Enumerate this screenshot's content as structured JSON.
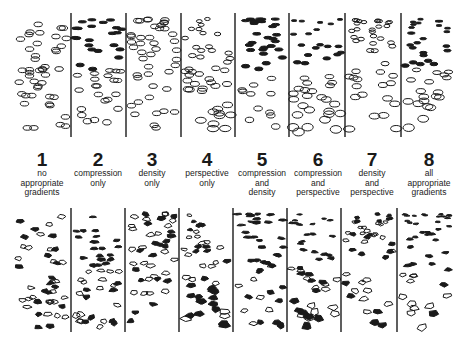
{
  "figure": {
    "top_row": {
      "description": "texture gradient panels (ellipse elements)",
      "y_top": 15,
      "y_bottom": 137,
      "dividers_x": [
        71,
        126,
        181,
        235,
        289,
        345,
        401
      ]
    },
    "bottom_row": {
      "description": "texture gradient panels (irregular elements)",
      "y_top": 210,
      "y_bottom": 332,
      "dividers_x": [
        71,
        125,
        179,
        233,
        287,
        341,
        397
      ]
    },
    "conditions": [
      {
        "number": "1",
        "lines": [
          "no",
          "appropriate",
          "gradients"
        ],
        "x": 42
      },
      {
        "number": "2",
        "lines": [
          "compression",
          "only"
        ],
        "x": 98
      },
      {
        "number": "3",
        "lines": [
          "density",
          "only"
        ],
        "x": 152
      },
      {
        "number": "4",
        "lines": [
          "perspective",
          "only"
        ],
        "x": 207
      },
      {
        "number": "5",
        "lines": [
          "compression",
          "and",
          "density"
        ],
        "x": 262
      },
      {
        "number": "6",
        "lines": [
          "compression",
          "and",
          "perspective"
        ],
        "x": 318
      },
      {
        "number": "7",
        "lines": [
          "density",
          "and",
          "perspective"
        ],
        "x": 372
      },
      {
        "number": "8",
        "lines": [
          "all",
          "appropriate",
          "gradients"
        ],
        "x": 429
      }
    ],
    "colors": {
      "ink": "#1a1a1a",
      "background": "#ffffff"
    }
  }
}
